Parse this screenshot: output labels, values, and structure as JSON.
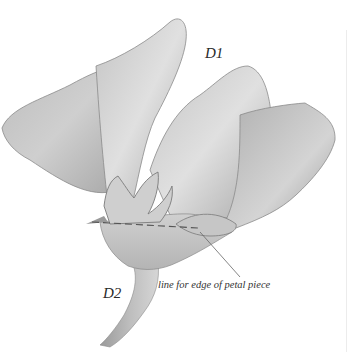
{
  "figure": {
    "labels": {
      "d1": "D1",
      "d2": "D2",
      "annotation": "line for edge of petal piece"
    },
    "colors": {
      "background": "#ffffff",
      "petal_light": "#d9d9d9",
      "petal_mid": "#b8b8b8",
      "petal_dark": "#8f8f8f",
      "outline": "#6e6e6e",
      "label_text": "#2a2a2a"
    }
  }
}
